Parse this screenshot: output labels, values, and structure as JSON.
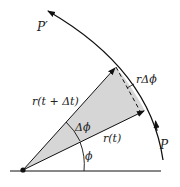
{
  "diagram": {
    "labels": {
      "p_prime": "P′",
      "p": "P",
      "r_delta_phi": "rΔϕ",
      "r_t_dt": "r(t + Δt)",
      "r_t": "r(t)",
      "delta_phi": "Δϕ",
      "phi": "ϕ"
    },
    "colors": {
      "line": "#111111",
      "sector_fill": "#d6d6d6",
      "background": "#ffffff"
    },
    "elements": [
      "orbit-arc",
      "sector-wedge",
      "radius-vector-r-t",
      "radius-vector-r-t-plus-dt",
      "chord-dashed",
      "angle-arc-phi",
      "angle-arc-delta-phi",
      "baseline",
      "origin-point"
    ]
  }
}
